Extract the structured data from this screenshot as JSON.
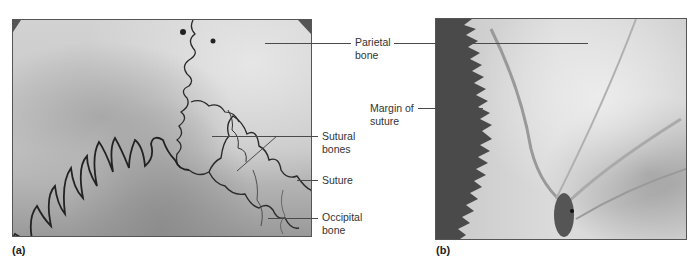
{
  "figure": {
    "panels": [
      {
        "id": "a",
        "panel_label": "(a)",
        "description": "Skull surface showing sutures and sutural bones",
        "labels": [
          {
            "text_line1": "Parietal",
            "text_line2": "bone"
          },
          {
            "text_line1": "Sutural",
            "text_line2": "bones"
          },
          {
            "text_line1": "Suture",
            "text_line2": ""
          },
          {
            "text_line1": "Occipital",
            "text_line2": "bone"
          }
        ]
      },
      {
        "id": "b",
        "panel_label": "(b)",
        "description": "Close-up of parietal bone with margin of suture",
        "labels": [
          {
            "text_line1": "Parietal",
            "text_line2": "bone"
          },
          {
            "text_line1": "Margin of",
            "text_line2": "suture"
          }
        ]
      }
    ],
    "colors": {
      "leader_line": "#4a4a4a",
      "label_text": "#333333",
      "suture_line": "#2a2a2a",
      "dark_background_b": "#4a4a4a"
    }
  }
}
